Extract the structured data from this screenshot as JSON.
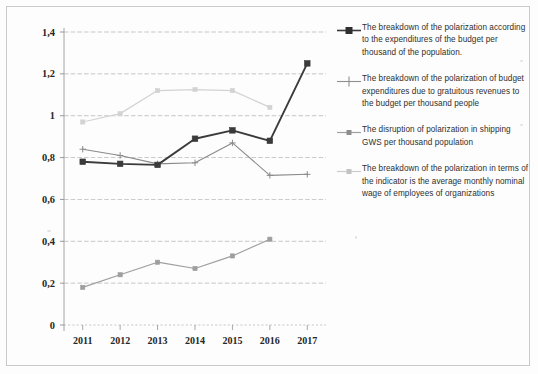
{
  "figure": {
    "name": "polarization-line-chart"
  },
  "chart_data": {
    "type": "line",
    "title": "",
    "subtitle": "",
    "xlabel": "",
    "ylabel": "",
    "categories": [
      "2011",
      "2012",
      "2013",
      "2014",
      "2015",
      "2016",
      "2017"
    ],
    "x_tick_labels": [
      "2011",
      "2012",
      "2013",
      "2014",
      "2015",
      "2016",
      "2017"
    ],
    "y_tick_labels": [
      "0",
      "0,2",
      "0,4",
      "0,6",
      "0,8",
      "1",
      "1,2",
      "1,4"
    ],
    "y_tick_values": [
      0,
      0.2,
      0.4,
      0.6,
      0.8,
      1.0,
      1.2,
      1.4
    ],
    "ylim": [
      0,
      1.4
    ],
    "grid": true,
    "grid_axis": "y",
    "legend_position": "right",
    "decimal_separator": ",",
    "series": [
      {
        "name": "The breakdown of the polarization according to the expenditures of the budget per thousand of the population.",
        "color": "#3b3b3b",
        "marker": "square",
        "line_width": 1.9,
        "values": [
          0.78,
          0.77,
          0.765,
          0.89,
          0.93,
          0.88,
          1.25
        ]
      },
      {
        "name": "The breakdown of the polarization of budget expenditures due to gratuitous revenues to the budget per thousand people",
        "color": "#8a8a8a",
        "marker": "cross",
        "line_width": 1.1,
        "values": [
          0.84,
          0.81,
          0.77,
          0.775,
          0.87,
          0.715,
          0.72
        ]
      },
      {
        "name": "The disruption of polarization in shipping GWS per thousand population",
        "color": "#9e9e9e",
        "marker": "square",
        "line_width": 1.2,
        "values": [
          0.18,
          0.24,
          0.3,
          0.27,
          0.33,
          0.41,
          null
        ]
      },
      {
        "name": "The breakdown of the polarization in terms of the indicator is the average monthly nominal wage of employees of organizations",
        "color": "#d3d3d3",
        "marker": "square",
        "line_width": 1.2,
        "values": [
          0.97,
          1.01,
          1.12,
          1.125,
          1.12,
          1.04,
          null
        ]
      }
    ]
  },
  "legend": {
    "items": [
      {
        "label": "The breakdown of the polarization according to the expenditures of the budget per thousand of the population.",
        "marker_icon": "line-square-marker-icon",
        "color": "#3b3b3b"
      },
      {
        "label": "The breakdown of the polarization of budget expenditures due to gratuitous revenues to the budget per thousand people",
        "marker_icon": "line-cross-marker-icon",
        "color": "#8a8a8a"
      },
      {
        "label": "The disruption of polarization in shipping GWS per thousand population",
        "marker_icon": "line-square-marker-icon",
        "color": "#9e9e9e"
      },
      {
        "label": "The breakdown of the polarization in terms of the indicator is the average monthly nominal wage of employees of organizations",
        "marker_icon": "line-square-marker-icon",
        "color": "#c9c9c9"
      }
    ]
  }
}
